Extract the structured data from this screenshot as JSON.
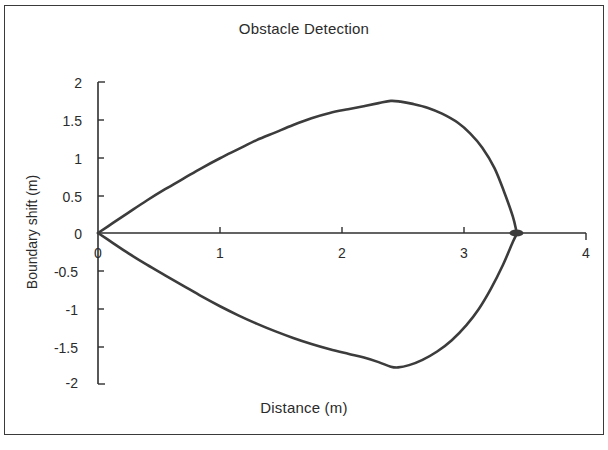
{
  "chart_data": {
    "type": "line",
    "title": "Obstacle Detection",
    "xlabel": "Distance (m)",
    "ylabel": "Boundary shift (m)",
    "xlim": [
      0,
      4
    ],
    "ylim": [
      -2,
      2
    ],
    "xticks": [
      "0",
      "1",
      "2",
      "3",
      "4"
    ],
    "yticks": [
      "2",
      "1.5",
      "1",
      "0.5",
      "0",
      "-0.5",
      "-1",
      "-1.5",
      "-2"
    ],
    "grid": false,
    "legend": null,
    "line_color": "#3c3c3c",
    "background_color": "#ffffff",
    "annotations": [
      {
        "name": "convergence-marker",
        "x": 3.43,
        "y": 0.0,
        "shape": "filled-ellipse"
      }
    ],
    "series": [
      {
        "name": "upper-boundary",
        "x": [
          0.0,
          0.12,
          0.25,
          0.4,
          0.55,
          0.7,
          0.85,
          1.0,
          1.15,
          1.3,
          1.45,
          1.6,
          1.75,
          1.9,
          2.05,
          2.18,
          2.3,
          2.4,
          2.48,
          2.58,
          2.7,
          2.82,
          2.95,
          3.05,
          3.15,
          3.25,
          3.33,
          3.4,
          3.43
        ],
        "y": [
          0.0,
          0.13,
          0.27,
          0.43,
          0.58,
          0.72,
          0.86,
          0.99,
          1.11,
          1.23,
          1.33,
          1.43,
          1.52,
          1.59,
          1.64,
          1.68,
          1.72,
          1.75,
          1.74,
          1.71,
          1.66,
          1.58,
          1.46,
          1.32,
          1.13,
          0.86,
          0.54,
          0.22,
          0.02
        ]
      },
      {
        "name": "lower-boundary",
        "x": [
          0.0,
          0.12,
          0.25,
          0.4,
          0.55,
          0.7,
          0.85,
          1.0,
          1.15,
          1.3,
          1.45,
          1.6,
          1.75,
          1.9,
          2.05,
          2.18,
          2.3,
          2.4,
          2.46,
          2.55,
          2.66,
          2.78,
          2.9,
          3.02,
          3.12,
          3.22,
          3.32,
          3.4,
          3.43
        ],
        "y": [
          0.0,
          -0.13,
          -0.27,
          -0.42,
          -0.56,
          -0.7,
          -0.84,
          -0.97,
          -1.09,
          -1.2,
          -1.3,
          -1.39,
          -1.47,
          -1.54,
          -1.6,
          -1.65,
          -1.71,
          -1.77,
          -1.78,
          -1.75,
          -1.68,
          -1.57,
          -1.42,
          -1.22,
          -1.01,
          -0.74,
          -0.42,
          -0.12,
          -0.02
        ]
      }
    ]
  },
  "axes": {
    "x_axis_name": "x-axis-line",
    "y_axis_name": "y-axis-line"
  }
}
